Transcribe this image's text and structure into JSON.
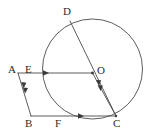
{
  "figure": {
    "stroke_color": "#4a4a4a",
    "label_color": "#2b2b2b",
    "background_color": "#ffffff",
    "circle": {
      "center_label": "O",
      "cx": 92.5,
      "cy": 69,
      "r": 50
    },
    "points": [
      {
        "id": "A",
        "label": "A",
        "x": 18,
        "y": 73,
        "label_x": 8,
        "label_y": 64
      },
      {
        "id": "E",
        "label": "E",
        "x": 43,
        "y": 73,
        "label_x": 25,
        "label_y": 64
      },
      {
        "id": "O",
        "label": "O",
        "x": 92.5,
        "y": 73,
        "label_x": 97,
        "label_y": 65
      },
      {
        "id": "D",
        "label": "D",
        "x": 70,
        "y": 21,
        "label_x": 63,
        "label_y": 6
      },
      {
        "id": "B",
        "label": "B",
        "x": 31,
        "y": 116,
        "label_x": 25,
        "label_y": 118
      },
      {
        "id": "F",
        "label": "F",
        "x": 62,
        "y": 116,
        "label_x": 55,
        "label_y": 118
      },
      {
        "id": "C",
        "label": "C",
        "x": 116,
        "y": 116,
        "label_x": 113,
        "label_y": 118
      }
    ],
    "segments": [
      {
        "id": "AO",
        "from": "A",
        "to": "O",
        "x1": 18,
        "y1": 73,
        "x2": 92.5,
        "y2": 73,
        "ticks": 1
      },
      {
        "id": "BC",
        "from": "B",
        "to": "C",
        "x1": 31,
        "y1": 116,
        "x2": 116,
        "y2": 116,
        "ticks": 1
      },
      {
        "id": "AB",
        "from": "A",
        "to": "B",
        "x1": 18,
        "y1": 73,
        "x2": 31,
        "y2": 116,
        "ticks": 2
      },
      {
        "id": "OC",
        "from": "O",
        "to": "C",
        "x1": 92.5,
        "y1": 73,
        "x2": 116,
        "y2": 116,
        "ticks": 2
      },
      {
        "id": "DC",
        "from": "D",
        "to": "C",
        "x1": 70,
        "y1": 21,
        "x2": 116,
        "y2": 116,
        "ticks": 0
      }
    ]
  }
}
